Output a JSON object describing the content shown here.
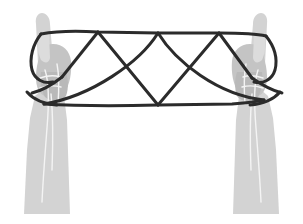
{
  "illustration": {
    "title": "Cat's Cradle String Figure",
    "subject": "two-hands-holding-string-figure",
    "canvas": {
      "width": 303,
      "height": 224,
      "background": "#ffffff"
    },
    "colors": {
      "background": "#ffffff",
      "arm_light": "#d3d3d3",
      "hand_mid": "#c4c4c4",
      "palm_shadow": "#b4b4b4",
      "finger_highlight": "#dcdcdc",
      "crease_line": "#f2f2f2",
      "string_dark": "#2b2b2b",
      "string_outline": "#1a1a1a"
    },
    "parts": [
      {
        "name": "left-hand",
        "label": "Left hand, index finger raised"
      },
      {
        "name": "right-hand",
        "label": "Right hand, index finger raised"
      },
      {
        "name": "string-figure",
        "label": "Looped string forming zigzag pattern"
      }
    ]
  },
  "left_hand": {
    "label": "Left hand",
    "forearm_path": "M 24 214 L 32 120 L 40 92 L 56 88 L 64 120 L 70 214 Z",
    "fist_path": "M 36 62 C 34 54 40 48 48 47 C 58 46 66 52 68 62 C 72 74 72 86 68 96 C 62 104 48 106 40 100 C 34 94 33 76 36 62 Z",
    "index_finger_path": "M 36 24 C 35 18 38 14 42 14 C 46 14 49 18 49 24 L 51 62 C 51 70 42 72 39 66 Z",
    "knuckle_path": "M 40 56 C 38 50 44 45 52 45 C 62 45 68 51 69 60 C 70 70 68 82 63 90 C 56 96 45 95 40 88 C 36 80 38 66 40 56 Z",
    "crease_paths": [
      "M 44 70 C 48 80 48 100 46 124 C 44 150 42 176 41 200",
      "M 56 66 C 58 76 58 92 57 106",
      "M 50 92 C 52 112 52 140 51 168"
    ]
  },
  "right_hand": {
    "label": "Right hand",
    "forearm_path": "M 279 214 L 271 120 L 263 92 L 247 88 L 239 120 L 233 214 Z",
    "fist_path": "M 267 62 C 269 54 263 48 255 47 C 245 46 237 52 235 62 C 231 74 231 86 235 96 C 241 104 255 106 263 100 C 269 94 270 76 267 62 Z",
    "index_finger_path": "M 267 24 C 268 18 265 14 261 14 C 257 14 254 18 254 24 L 252 62 C 252 70 261 72 264 66 Z",
    "knuckle_path": "M 263 56 C 265 50 259 45 251 45 C 241 45 235 51 234 60 C 233 70 235 82 240 90 C 247 96 258 95 263 88 C 267 80 265 66 263 56 Z",
    "crease_paths": [
      "M 259 70 C 255 80 255 100 257 124 C 259 150 261 176 262 200",
      "M 247 66 C 245 76 245 92 246 106",
      "M 253 92 C 251 112 251 140 252 168"
    ],
    "finger_lines": [
      "M 236 72 C 244 70 252 70 258 72",
      "M 236 82 C 244 80 252 80 258 82",
      "M 238 92 C 245 90 252 90 257 92"
    ]
  },
  "string_figure": {
    "label": "String loop pattern",
    "stroke_width": 3,
    "top_rail": {
      "name": "top-horizontal-string",
      "path": "M 41 34 C 70 29 86 31 98 32 L 158 33 L 219 33 C 240 33 258 34 266 36"
    },
    "bottom_rail": {
      "name": "bottom-horizontal-string",
      "path": "M 44 103 C 70 104 110 105 158 105 L 232 104 C 248 103 258 101 264 99"
    },
    "zigzag_segments": [
      {
        "name": "zig-1",
        "path": "M 62 77 L 98 32"
      },
      {
        "name": "zig-2",
        "path": "M 98 32 L 158 105"
      },
      {
        "name": "zig-3",
        "path": "M 158 105 L 219 33"
      },
      {
        "name": "zig-4",
        "path": "M 219 33 L 252 78"
      }
    ],
    "cross_segments": [
      {
        "name": "cross-left",
        "path": "M 44 103 C 90 94 140 62 158 33"
      },
      {
        "name": "cross-right",
        "path": "M 264 99 C 218 94 176 62 158 33"
      }
    ],
    "wrap_segments": [
      {
        "name": "left-finger-wrap-upper",
        "path": "M 41 34 C 34 44 30 58 33 70 C 36 80 44 84 52 82"
      },
      {
        "name": "left-finger-wrap-lower",
        "path": "M 62 77 C 52 84 40 90 33 92"
      },
      {
        "name": "left-wrist-wrap",
        "path": "M 28 92 C 34 98 44 103 56 104"
      },
      {
        "name": "right-finger-wrap-upper",
        "path": "M 266 36 C 273 46 277 58 274 70 C 271 80 263 84 255 82"
      },
      {
        "name": "right-finger-wrap-lower",
        "path": "M 252 78 C 262 84 274 90 281 92"
      },
      {
        "name": "right-wrist-wrap",
        "path": "M 279 92 C 273 98 263 103 251 104"
      }
    ],
    "vertices": [
      {
        "name": "top-peak-left",
        "x": 98,
        "y": 32
      },
      {
        "name": "top-peak-center",
        "x": 158,
        "y": 33
      },
      {
        "name": "top-peak-right",
        "x": 219,
        "y": 33
      },
      {
        "name": "bottom-valley-center",
        "x": 158,
        "y": 105
      },
      {
        "name": "left-anchor",
        "x": 44,
        "y": 103
      },
      {
        "name": "right-anchor",
        "x": 264,
        "y": 99
      }
    ]
  }
}
